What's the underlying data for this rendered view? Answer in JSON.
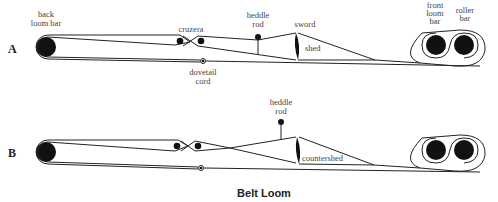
{
  "title": "Belt Loom",
  "panels": [
    {
      "id": "A",
      "label": "A",
      "labels": {
        "back_bar_1": "back",
        "back_bar_2": "loom bar",
        "cruzera": "cruzera",
        "heddle_1": "heddle",
        "heddle_2": "rod",
        "sword": "sword",
        "shed": "shed",
        "dovetail_1": "dovetail",
        "dovetail_2": "cord",
        "front_1": "front",
        "front_2": "loom",
        "front_3": "bar",
        "roller_1": "roller",
        "roller_2": "bar"
      }
    },
    {
      "id": "B",
      "label": "B",
      "labels": {
        "heddle_1": "heddle",
        "heddle_2": "rod",
        "countershed": "countershed"
      }
    }
  ]
}
